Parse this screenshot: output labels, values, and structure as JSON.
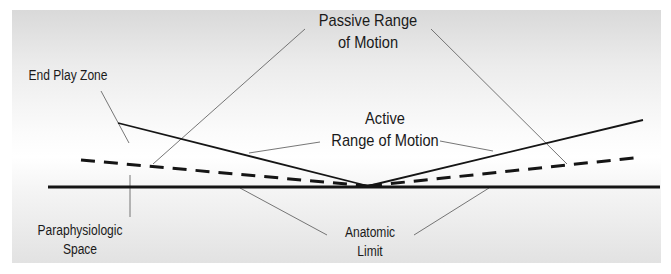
{
  "diagram": {
    "labels": {
      "passive_line1": "Passive Range",
      "passive_line2": "of Motion",
      "active_line1": "Active",
      "active_line2": "Range of Motion",
      "end_play": "End Play Zone",
      "paraphysiologic_line1": "Paraphysiologic",
      "paraphysiologic_line2": "Space",
      "anatomic_line1": "Anatomic",
      "anatomic_line2": "Limit"
    },
    "colors": {
      "line": "#1a1a1a",
      "leader": "#555555",
      "panel_top": "#d9d9d9",
      "panel_mid": "#ffffff",
      "panel_bottom": "#e2e2e2"
    },
    "geometry": {
      "vertex": [
        368,
        186
      ],
      "baseline": {
        "x1": 48,
        "x2": 660,
        "y": 187
      },
      "active_left_end": [
        118,
        123
      ],
      "active_right_end": [
        643,
        120
      ],
      "passive_left_end": [
        81,
        160
      ],
      "passive_right_end": [
        634,
        158
      ]
    }
  }
}
